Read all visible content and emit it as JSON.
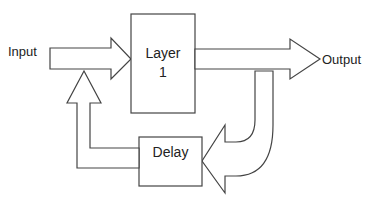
{
  "diagram": {
    "input_label": "Input",
    "output_label": "Output",
    "layer": {
      "line1": "Layer",
      "line2": "1"
    },
    "delay_label": "Delay",
    "stroke_color": "#444444",
    "fill_color": "#ffffff"
  }
}
